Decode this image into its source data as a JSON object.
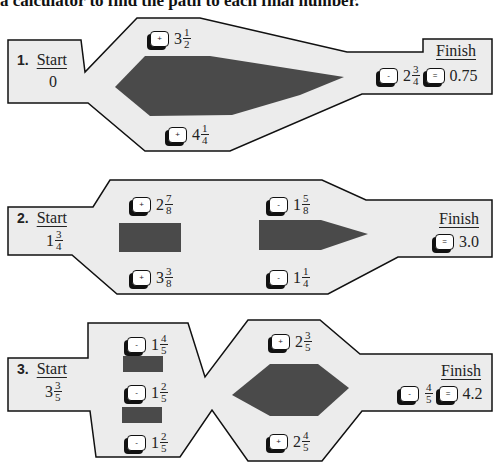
{
  "header": {
    "text": "a calculator to find the path to each final number."
  },
  "colors": {
    "panel_fill": "#ececec",
    "dark_fill": "#4a4a4a",
    "outline": "#111111"
  },
  "labels": {
    "start": "Start",
    "finish": "Finish"
  },
  "puzzles": [
    {
      "number": "1.",
      "start": {
        "whole": "0",
        "num": "",
        "den": ""
      },
      "top": {
        "op": "+",
        "whole": "3",
        "num": "1",
        "den": "2"
      },
      "bottom": {
        "op": "+",
        "whole": "4",
        "num": "1",
        "den": "4"
      },
      "finish_op": {
        "op": "-",
        "whole": "2",
        "num": "3",
        "den": "4"
      },
      "equals": "=",
      "result": "0.75"
    },
    {
      "number": "2.",
      "start": {
        "whole": "1",
        "num": "3",
        "den": "4"
      },
      "top_left": {
        "op": "+",
        "whole": "2",
        "num": "7",
        "den": "8"
      },
      "bottom_left": {
        "op": "+",
        "whole": "3",
        "num": "3",
        "den": "8"
      },
      "top_right": {
        "op": "-",
        "whole": "1",
        "num": "5",
        "den": "8"
      },
      "bottom_right": {
        "op": "-",
        "whole": "1",
        "num": "1",
        "den": "4"
      },
      "equals": "=",
      "result": "3.0"
    },
    {
      "number": "3.",
      "start": {
        "whole": "3",
        "num": "3",
        "den": "5"
      },
      "left_top": {
        "op": "-",
        "whole": "1",
        "num": "4",
        "den": "5"
      },
      "left_middle": {
        "op": "-",
        "whole": "1",
        "num": "2",
        "den": "5"
      },
      "left_bottom": {
        "op": "-",
        "whole": "1",
        "num": "2",
        "den": "5"
      },
      "right_top": {
        "op": "+",
        "whole": "2",
        "num": "3",
        "den": "5"
      },
      "right_bottom": {
        "op": "+",
        "whole": "2",
        "num": "4",
        "den": "5"
      },
      "finish_op": {
        "op": "-",
        "whole": "",
        "num": "4",
        "den": "5"
      },
      "equals": "=",
      "result": "4.2"
    }
  ]
}
